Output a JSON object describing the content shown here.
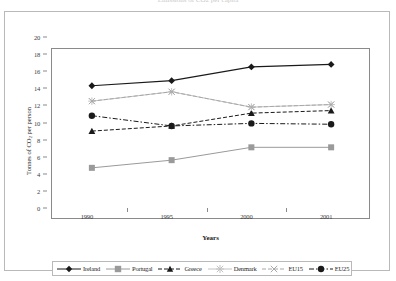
{
  "top_caption": "Emissions of CO2 per capita",
  "chart_data": {
    "type": "line",
    "title": "",
    "xlabel": "Years",
    "ylabel": "Tonnes of CO2 per person",
    "ylabel_main": "Tonnes of CO",
    "ylabel_sub": "2",
    "ylabel_tail": " per person",
    "categories": [
      "1990",
      "1995",
      "2000",
      "2001"
    ],
    "x": [
      1990,
      1995,
      2000,
      2001
    ],
    "ylim": [
      0,
      20
    ],
    "yticks": [
      0,
      2,
      4,
      6,
      8,
      10,
      12,
      14,
      16,
      18,
      20
    ],
    "grid": false,
    "legend_position": "bottom",
    "series": [
      {
        "name": "Ireland",
        "values": [
          15.7,
          16.3,
          17.9,
          18.2
        ],
        "color": "#1a1a1a",
        "marker": "diamond",
        "dash": "solid"
      },
      {
        "name": "Portugal",
        "values": [
          6.1,
          7.0,
          8.5,
          8.5
        ],
        "color": "#9a9a9a",
        "marker": "square",
        "dash": "solid"
      },
      {
        "name": "Greece",
        "values": [
          10.4,
          11.0,
          12.5,
          12.8
        ],
        "color": "#1a1a1a",
        "marker": "triangle",
        "dash": "dashed"
      },
      {
        "name": "Denmark",
        "values": [
          13.9,
          15.0,
          13.2,
          13.5
        ],
        "color": "#c2c2c2",
        "marker": "star",
        "dash": "solid"
      },
      {
        "name": "EU15",
        "values": [
          13.9,
          15.0,
          13.2,
          13.5
        ],
        "color": "#a8a8a8",
        "marker": "cross",
        "dash": "dashed"
      },
      {
        "name": "EU25",
        "values": [
          12.2,
          11.0,
          11.3,
          11.2
        ],
        "color": "#1a1a1a",
        "marker": "circle",
        "dash": "dashdot"
      }
    ]
  }
}
